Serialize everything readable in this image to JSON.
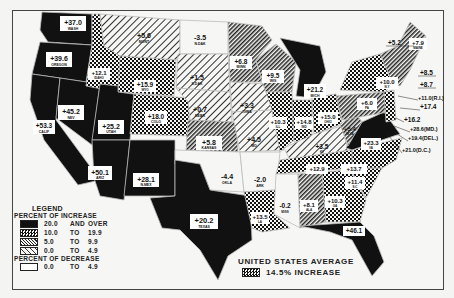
{
  "legend": {
    "title": "LEGEND",
    "increase_header": "PERCENT OF INCREASE",
    "decrease_header": "PERCENT OF DECREASE",
    "rows": [
      {
        "from": "20.0",
        "sep": "AND",
        "to": "OVER",
        "pattern": "solid"
      },
      {
        "from": "10.0",
        "sep": "TO",
        "to": "19.9",
        "pattern": "check"
      },
      {
        "from": "5.0",
        "sep": "TO",
        "to": "9.9",
        "pattern": "dense-hatch"
      },
      {
        "from": "0.0",
        "sep": "TO",
        "to": "4.9",
        "pattern": "light-hatch"
      }
    ],
    "decrease_rows": [
      {
        "from": "0.0",
        "sep": "TO",
        "to": "4.9",
        "pattern": "white"
      }
    ]
  },
  "average": {
    "line1": "UNITED STATES AVERAGE",
    "line2": "14.5% INCREASE"
  },
  "states": [
    {
      "abbr": "WASH",
      "value": "+37.0"
    },
    {
      "abbr": "OREGON",
      "value": "+39.6"
    },
    {
      "abbr": "CALIF",
      "value": "+53.3"
    },
    {
      "abbr": "NEV",
      "value": "+45.2"
    },
    {
      "abbr": "IDAHO",
      "value": "+12.1"
    },
    {
      "abbr": "MONT",
      "value": "+5.6"
    },
    {
      "abbr": "WYO",
      "value": "+15.9"
    },
    {
      "abbr": "UTAH",
      "value": "+25.2"
    },
    {
      "abbr": "COLO",
      "value": "+18.0"
    },
    {
      "abbr": "ARIZ",
      "value": "+50.1"
    },
    {
      "abbr": "N.MEX",
      "value": "+28.1"
    },
    {
      "abbr": "N.DAK",
      "value": "-3.5"
    },
    {
      "abbr": "S.DAK",
      "value": "+1.5"
    },
    {
      "abbr": "NEBR",
      "value": "+0.7"
    },
    {
      "abbr": "KANSAS",
      "value": "+5.8"
    },
    {
      "abbr": "OKLA",
      "value": "-4.4"
    },
    {
      "abbr": "TEXAS",
      "value": "+20.2"
    },
    {
      "abbr": "MINN",
      "value": "+6.8"
    },
    {
      "abbr": "IOWA",
      "value": "+3.3"
    },
    {
      "abbr": "MO",
      "value": "+4.5"
    },
    {
      "abbr": "ARK",
      "value": "-2.0"
    },
    {
      "abbr": "LA",
      "value": "+13.5"
    },
    {
      "abbr": "WIS",
      "value": "+9.5"
    },
    {
      "abbr": "ILL",
      "value": "+10.3"
    },
    {
      "abbr": "MICH",
      "value": "+21.2"
    },
    {
      "abbr": "IND",
      "value": "+14.8"
    },
    {
      "abbr": "OHIO",
      "value": "+15.0"
    },
    {
      "abbr": "KY",
      "value": "+3.5"
    },
    {
      "abbr": "TENN",
      "value": "+12.9"
    },
    {
      "abbr": "MISS",
      "value": "-0.2"
    },
    {
      "abbr": "ALA",
      "value": "+8.1"
    },
    {
      "abbr": "GA",
      "value": "+10.3"
    },
    {
      "abbr": "FLA",
      "value": "+46.1"
    },
    {
      "abbr": "S.C",
      "value": "+11.4"
    },
    {
      "abbr": "N.C",
      "value": "+13.7"
    },
    {
      "abbr": "VA",
      "value": "+23.3"
    },
    {
      "abbr": "W.VA",
      "value": "+5.4"
    },
    {
      "abbr": "PA",
      "value": "+6.0"
    },
    {
      "abbr": "N.Y",
      "value": "+10.0"
    },
    {
      "abbr": "MAINE",
      "value": "+7.9"
    },
    {
      "abbr": "N.H",
      "value": "+5.2"
    },
    {
      "abbr": "VT",
      "value": "+8.5"
    },
    {
      "abbr": "MASS",
      "value": "+8.7"
    },
    {
      "abbr": "R.I",
      "value": "+11.0(R.I.)"
    },
    {
      "abbr": "CONN",
      "value": "+17.4"
    },
    {
      "abbr": "N.J",
      "value": "+16.2"
    },
    {
      "abbr": "MD",
      "value": "+28.6(MD.)"
    },
    {
      "abbr": "DEL",
      "value": "+19.4(DEL.)"
    },
    {
      "abbr": "D.C",
      "value": "+21.0(D.C.)"
    }
  ],
  "colors": {
    "ink": "#111111",
    "paper": "#f6f6f4"
  }
}
